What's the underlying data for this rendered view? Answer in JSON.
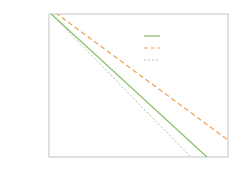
{
  "panel_label": "(b)",
  "chart_data": {
    "type": "scatter",
    "title": "",
    "xlabel": "k",
    "ylabel": "P_k",
    "xscale": "log",
    "yscale": "log",
    "xlim": [
      1,
      10000
    ],
    "ylim": [
      1e-09,
      1
    ],
    "xticks": [
      "10^0",
      "10^1",
      "10^2",
      "10^3",
      "10^4"
    ],
    "yticks": [
      "10^-1",
      "10^-3",
      "10^-5",
      "10^-7",
      "10^-9"
    ],
    "grid": false,
    "legend_position": "upper right",
    "series": [
      {
        "name": "data",
        "kind": "markers",
        "color": "#3a3550",
        "x": [
          2,
          4,
          9.5,
          21,
          46,
          90,
          200,
          440,
          760,
          2400,
          4200,
          10000
        ],
        "y": [
          0.32,
          0.032,
          0.004,
          0.00063,
          0.00013,
          2e-05,
          4e-06,
          8e-07,
          1.3e-07,
          1.8e-08,
          4e-09,
          2.5e-09
        ]
      },
      {
        "name": "k^{-2.255}/ln k",
        "kind": "line",
        "style": "solid",
        "color": "#8cc06a"
      },
      {
        "name": "~k^{-2.255}",
        "kind": "line",
        "style": "dashed",
        "color": "#f0a050"
      },
      {
        "name": "~k^{-3}",
        "kind": "line",
        "style": "dotted",
        "color": "#a9c49a"
      }
    ]
  },
  "legend": {
    "items": [
      {
        "base": "k",
        "sup": "-2.255",
        "suffix": "/ln k",
        "prefix": ""
      },
      {
        "base": "k",
        "sup": "-2.255",
        "suffix": "",
        "prefix": "~"
      },
      {
        "base": "k",
        "sup": "-3",
        "suffix": "",
        "prefix": "~"
      }
    ]
  },
  "axes": {
    "x_ticks": [
      {
        "base": "10",
        "exp": "0"
      },
      {
        "base": "10",
        "exp": "1"
      },
      {
        "base": "10",
        "exp": "2"
      },
      {
        "base": "10",
        "exp": "3"
      },
      {
        "base": "10",
        "exp": "4"
      }
    ],
    "y_ticks": [
      {
        "base": "10",
        "exp": "-1"
      },
      {
        "base": "10",
        "exp": "-3"
      },
      {
        "base": "10",
        "exp": "-5"
      },
      {
        "base": "10",
        "exp": "-7"
      },
      {
        "base": "10",
        "exp": "-9"
      }
    ],
    "xlabel": "k",
    "ylabel_base": "P",
    "ylabel_sub": "k"
  }
}
